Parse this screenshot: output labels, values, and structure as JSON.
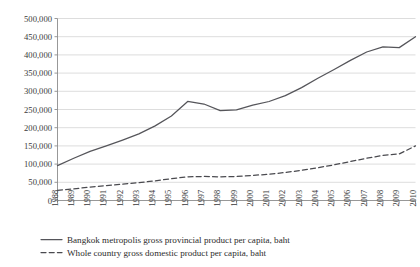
{
  "chart_data": {
    "type": "line",
    "title": "",
    "subtitle": "",
    "xlabel": "",
    "ylabel": "",
    "grid": true,
    "legend_position": "bottom-left",
    "xlim": [
      1988,
      2010
    ],
    "ylim": [
      0,
      500000
    ],
    "ytick_step": 50000,
    "categories": [
      "1988",
      "1989",
      "1990",
      "1991",
      "1992",
      "1993",
      "1994",
      "1995",
      "1996",
      "1997",
      "1998",
      "1999",
      "2000",
      "2001",
      "2002",
      "2003",
      "2004",
      "2005",
      "2006",
      "2007",
      "2008",
      "2009",
      "2010"
    ],
    "ytick_labels": [
      "0",
      "50,000",
      "100,000",
      "150,000",
      "200,000",
      "250,000",
      "300,000",
      "350,000",
      "400,000",
      "450,000",
      "500,000"
    ],
    "ytick_values": [
      0,
      50000,
      100000,
      150000,
      200000,
      250000,
      300000,
      350000,
      400000,
      450000,
      500000
    ],
    "series": [
      {
        "name": "Bangkok metropolis gross provincial product per capita, baht",
        "style": "solid",
        "color": "#55555a",
        "values": [
          96000,
          116000,
          135000,
          150000,
          166000,
          183000,
          205000,
          232000,
          272000,
          265000,
          247000,
          249000,
          262000,
          272000,
          288000,
          310000,
          336000,
          360000,
          385000,
          408000,
          422000,
          420000,
          450000
        ]
      },
      {
        "name": "Whole country gross domestic product per capita, baht",
        "style": "dashed",
        "color": "#4a4a4f",
        "values": [
          28000,
          32000,
          37000,
          41000,
          45000,
          49000,
          54000,
          60000,
          65000,
          66000,
          65000,
          66000,
          69000,
          72000,
          77000,
          83000,
          90000,
          98000,
          107000,
          116000,
          124000,
          128000,
          150000
        ]
      }
    ],
    "legend": [
      {
        "label": "Bangkok metropolis gross provincial product per capita, baht",
        "style": "solid"
      },
      {
        "label": "Whole country gross domestic product per capita, baht",
        "style": "dashed"
      }
    ],
    "colors": {
      "grid": "#d9d9d9",
      "axis": "#8c8c8c",
      "series_1": "#55555a",
      "series_2": "#4a4a4f",
      "background": "#ffffff"
    }
  }
}
